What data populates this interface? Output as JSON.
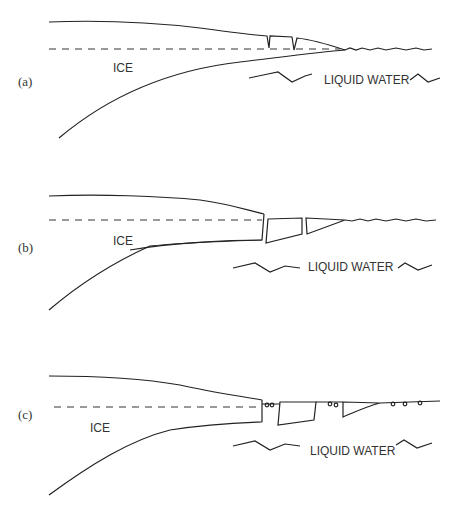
{
  "panels": [
    {
      "label": "(a)",
      "ice_label": "ICE",
      "water_label": "LIQUID WATER"
    },
    {
      "label": "(b)",
      "ice_label": "ICE",
      "water_label": "LIQUID WATER"
    },
    {
      "label": "(c)",
      "ice_label": "ICE",
      "water_label": "LIQUID WATER"
    }
  ]
}
